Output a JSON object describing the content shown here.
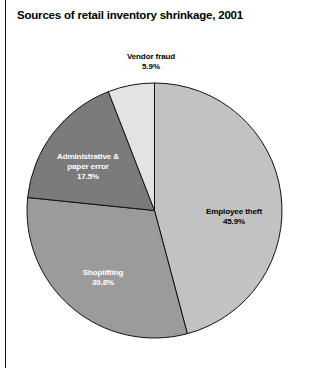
{
  "chart_data": {
    "type": "pie",
    "title": "Sources of retail inventory shrinkage, 2001",
    "xlabel": "",
    "ylabel": "",
    "legend_position": "none",
    "grid": false,
    "start_angle_deg": 0,
    "direction": "clockwise",
    "categories": [
      "Employee theft",
      "Shoplifting",
      "Administrative & paper error",
      "Vendor fraud"
    ],
    "values": [
      45.9,
      30.8,
      17.5,
      5.9
    ],
    "value_suffix": "%",
    "slices": [
      {
        "label": "Employee theft",
        "label_line1": "Employee theft",
        "value": 45.9,
        "value_text": "45.9%",
        "color": "#c2c2c2",
        "label_color": "#000000"
      },
      {
        "label": "Shoplifting",
        "label_line1": "Shoplifting",
        "value": 30.8,
        "value_text": "30.8%",
        "color": "#9b9b9b",
        "label_color": "#ffffff"
      },
      {
        "label": "Administrative & paper error",
        "label_line1": "Administrative &",
        "label_line2": "paper error",
        "value": 17.5,
        "value_text": "17.5%",
        "color": "#7b7b7b",
        "label_color": "#ffffff"
      },
      {
        "label": "Vendor fraud",
        "label_line1": "Vendor fraud",
        "value": 5.9,
        "value_text": "5.9%",
        "color": "#e3e3e3",
        "label_color": "#000000"
      }
    ]
  },
  "figure": {
    "title": "Sources of retail inventory shrinkage, 2001",
    "background": "#ffffff",
    "outline_color": "#111111"
  }
}
